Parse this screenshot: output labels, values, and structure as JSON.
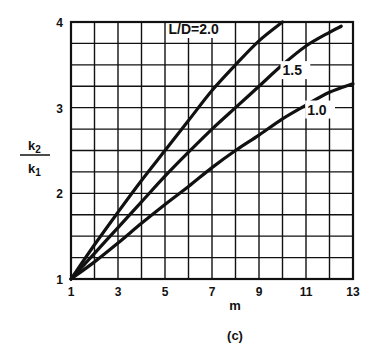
{
  "chart_data": {
    "type": "line",
    "title": "",
    "caption": "(c)",
    "xlabel": "m",
    "ylabel": {
      "numerator": "k",
      "numerator_sub": "2",
      "denominator": "k",
      "denominator_sub": "1"
    },
    "xlim": [
      1,
      13
    ],
    "ylim": [
      1,
      4
    ],
    "x_ticks": [
      1,
      3,
      5,
      7,
      9,
      11,
      13
    ],
    "y_ticks": [
      1,
      2,
      3,
      4
    ],
    "grid": {
      "x_step": 1,
      "y_step": 0.25
    },
    "series": [
      {
        "name": "L/D=2.0",
        "label": "L/D=2.0",
        "x": [
          1,
          2,
          3,
          4,
          5,
          6,
          7,
          8,
          9,
          10
        ],
        "values": [
          1.0,
          1.4,
          1.78,
          2.15,
          2.5,
          2.85,
          3.2,
          3.5,
          3.78,
          4.0
        ]
      },
      {
        "name": "L/D=1.5",
        "label": "1.5",
        "x": [
          1,
          2,
          3,
          4,
          5,
          6,
          7,
          8,
          9,
          10,
          11,
          12,
          12.5
        ],
        "values": [
          1.0,
          1.3,
          1.6,
          1.9,
          2.2,
          2.48,
          2.75,
          3.0,
          3.25,
          3.5,
          3.72,
          3.88,
          3.95
        ]
      },
      {
        "name": "L/D=1.0",
        "label": "1.0",
        "x": [
          1,
          2,
          3,
          4,
          5,
          6,
          7,
          8,
          9,
          10,
          11,
          12,
          13
        ],
        "values": [
          1.0,
          1.2,
          1.42,
          1.65,
          1.87,
          2.08,
          2.3,
          2.5,
          2.68,
          2.87,
          3.03,
          3.18,
          3.28
        ]
      }
    ],
    "annotations": [
      {
        "text": "L/D=2.0",
        "x": 5.15,
        "y": 3.86
      },
      {
        "text": "1.5",
        "x": 10.0,
        "y": 3.38
      },
      {
        "text": "1.0",
        "x": 11.05,
        "y": 2.92
      }
    ]
  }
}
